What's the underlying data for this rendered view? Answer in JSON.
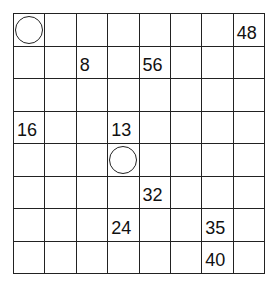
{
  "puzzle": {
    "title": "",
    "rows": 8,
    "cols": 8,
    "clues": [
      {
        "row": 1,
        "col": 8,
        "value": "48"
      },
      {
        "row": 2,
        "col": 3,
        "value": "8"
      },
      {
        "row": 2,
        "col": 5,
        "value": "56"
      },
      {
        "row": 4,
        "col": 1,
        "value": "16"
      },
      {
        "row": 4,
        "col": 4,
        "value": "13"
      },
      {
        "row": 6,
        "col": 5,
        "value": "32"
      },
      {
        "row": 7,
        "col": 4,
        "value": "24"
      },
      {
        "row": 7,
        "col": 7,
        "value": "35"
      },
      {
        "row": 8,
        "col": 7,
        "value": "40"
      }
    ],
    "circles": [
      {
        "row": 1,
        "col": 1
      },
      {
        "row": 5,
        "col": 4
      }
    ]
  },
  "colors": {
    "line": "#222222",
    "text": "#111111",
    "background": "#ffffff"
  }
}
